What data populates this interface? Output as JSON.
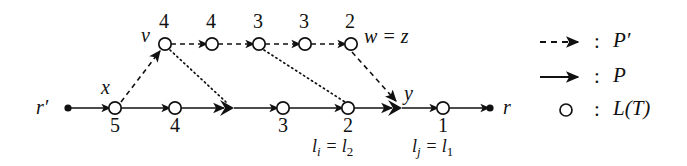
{
  "figure": {
    "background_color": "#ffffff",
    "ink_color": "#111111",
    "width": 687,
    "height": 166
  },
  "nodes": {
    "root_left_label": "r",
    "root_left_prime": "′",
    "root_right_label": "r",
    "v_label": "v",
    "x_label": "x",
    "y_label": "y",
    "w_label": "w = z"
  },
  "upper_path": {
    "name": "P-prime-path",
    "node_values": [
      "4",
      "4",
      "3",
      "3",
      "2"
    ],
    "node_positions_x": [
      165,
      212,
      259,
      305,
      351
    ],
    "node_y": 44,
    "edge_style": "dashed"
  },
  "lower_path": {
    "name": "P-path",
    "node_values": [
      "5",
      "4",
      "3",
      "2",
      "1"
    ],
    "node_positions_x": [
      115,
      175,
      283,
      348,
      443
    ],
    "filled_positions_x": [
      68,
      228,
      396,
      490
    ],
    "node_y": 108,
    "edge_style": "solid"
  },
  "annotations": {
    "li_text": "l",
    "li_sub": "i",
    "li_eq": " = l",
    "li_eq_sub": "2",
    "lj_text": "l",
    "lj_sub": "j",
    "lj_eq": " = l",
    "lj_eq_sub": "1"
  },
  "legend": {
    "items": [
      {
        "icon": "dashed-arrow-icon",
        "separator": ":",
        "label": "P′"
      },
      {
        "icon": "solid-arrow-icon",
        "separator": ":",
        "label": "P"
      },
      {
        "icon": "circle-icon",
        "separator": ":",
        "label": "L(T)"
      }
    ]
  }
}
